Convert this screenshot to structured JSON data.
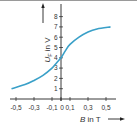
{
  "chart_data": {
    "type": "line",
    "title": "",
    "xlabel": "B in T",
    "ylabel": "U_F in V",
    "x_ticks": [
      "-0,5",
      "-0,3",
      "-0,1",
      "0",
      "0,1",
      "0,3",
      "0,5"
    ],
    "y_ticks": [
      "1",
      "2",
      "3",
      "4",
      "5",
      "6",
      "7",
      "8"
    ],
    "xlim": [
      -0.55,
      0.6
    ],
    "ylim": [
      0,
      8.5
    ],
    "grid": false,
    "legend": "none",
    "series": [
      {
        "name": "U_F(B)",
        "color": "#3aa0c8",
        "x": [
          -0.55,
          -0.4,
          -0.3,
          -0.2,
          -0.1,
          -0.05,
          0,
          0.05,
          0.1,
          0.2,
          0.3,
          0.4,
          0.55
        ],
        "y": [
          1.0,
          1.4,
          1.8,
          2.3,
          3.0,
          3.5,
          4.0,
          4.7,
          5.3,
          6.0,
          6.5,
          6.8,
          7.0
        ]
      }
    ]
  },
  "labels": {
    "x_axis": "B in T",
    "y_axis_var": "U",
    "y_axis_sub": "F",
    "y_axis_unit": " in V"
  }
}
